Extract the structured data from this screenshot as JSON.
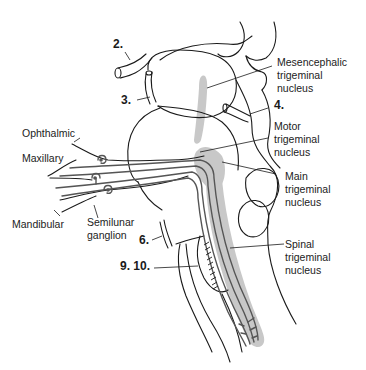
{
  "figure": {
    "type": "anatomical-diagram",
    "colors": {
      "outline": "#1a1a1a",
      "nerve_fibers": "#555555",
      "nucleus_shading": "#c8c8c8",
      "background": "#ffffff"
    }
  },
  "labels": {
    "mesencephalic": "Mesencephalic\ntrigeminal\nnucleus",
    "motor": "Motor\ntrigeminal\nnucleus",
    "main": "Main\ntrigeminal\nnucleus",
    "spinal": "Spinal\ntrigeminal\nnucleus",
    "ophthalmic": "Ophthalmic",
    "maxillary": "Maxillary",
    "mandibular": "Mandibular",
    "semilunar": "Semilunar\nganglion"
  },
  "cranial_nerve_numbers": {
    "n2": "2.",
    "n3": "3.",
    "n4": "4.",
    "n6": "6.",
    "n9_10": "9. 10."
  }
}
